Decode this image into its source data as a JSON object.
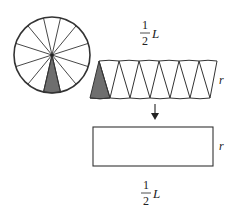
{
  "diagram": {
    "circle": {
      "sectors": 14,
      "shaded_sector": "bottom",
      "stroke": "#333333",
      "shade": "#6e6e6e"
    },
    "strip": {
      "label_top": {
        "numerator": "1",
        "denominator": "2",
        "variable": "L"
      },
      "label_side": "r",
      "triangles_up": 6,
      "triangles_down": 6
    },
    "arrow": {
      "direction": "down"
    },
    "rectangle": {
      "label_bottom": {
        "numerator": "1",
        "denominator": "2",
        "variable": "L"
      },
      "label_side": "r"
    }
  }
}
